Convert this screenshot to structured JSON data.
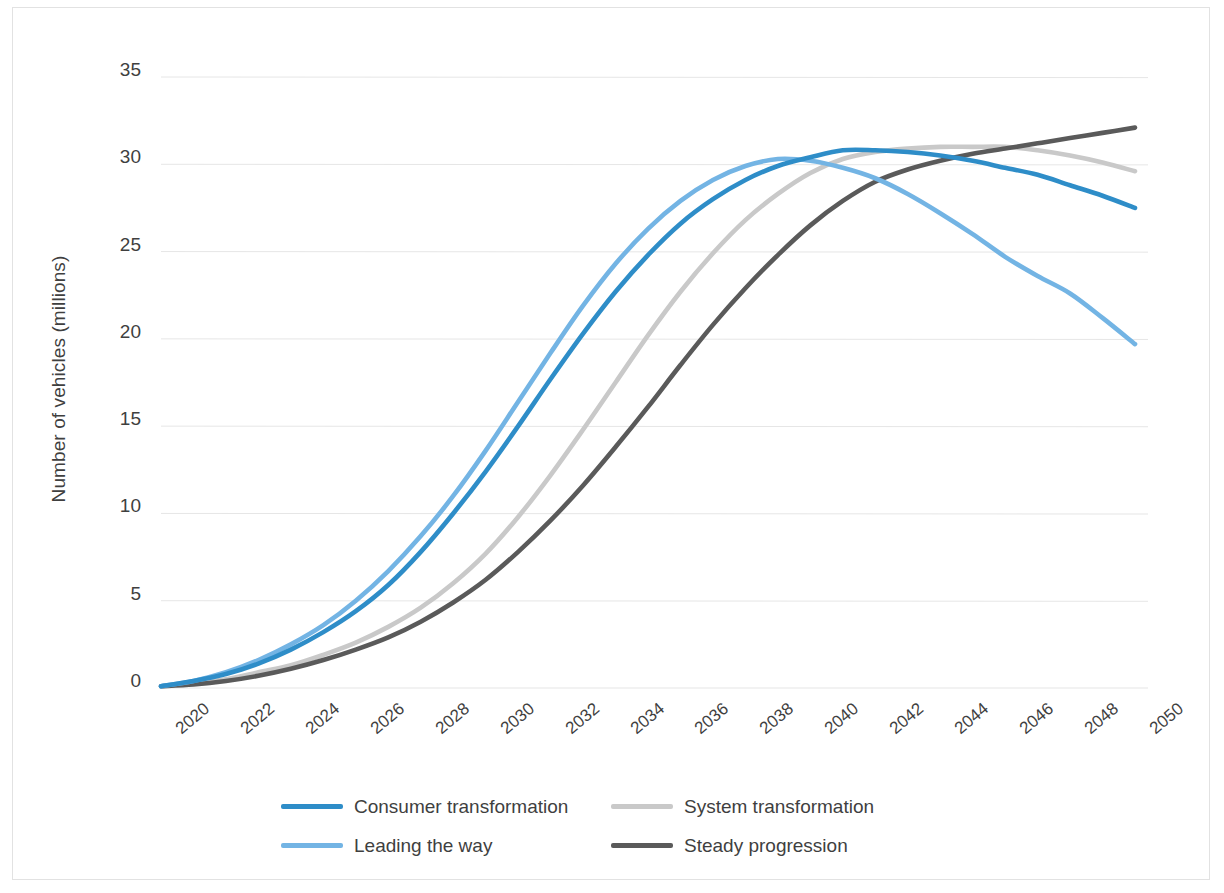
{
  "chart_data": {
    "type": "line",
    "title": "",
    "xlabel": "",
    "ylabel": "Number of vehicles (millions)",
    "xlim": [
      2020,
      2050
    ],
    "ylim": [
      0,
      35
    ],
    "ytick_values": [
      0,
      5,
      10,
      15,
      20,
      25,
      30,
      35
    ],
    "ytick_labels": [
      "0",
      "5",
      "10",
      "15",
      "20",
      "25",
      "30",
      "35"
    ],
    "xtick_labels": [
      "2020",
      "2022",
      "2024",
      "2026",
      "2028",
      "2030",
      "2032",
      "2034",
      "2036",
      "2038",
      "2040",
      "2042",
      "2044",
      "2046",
      "2048",
      "2050"
    ],
    "xtick_values": [
      2020,
      2022,
      2024,
      2026,
      2028,
      2030,
      2032,
      2034,
      2036,
      2038,
      2040,
      2042,
      2044,
      2046,
      2048,
      2050
    ],
    "grid": "horizontal",
    "legend_position": "bottom",
    "x": [
      2020,
      2021,
      2022,
      2023,
      2024,
      2025,
      2026,
      2027,
      2028,
      2029,
      2030,
      2031,
      2032,
      2033,
      2034,
      2035,
      2036,
      2037,
      2038,
      2039,
      2040,
      2041,
      2042,
      2043,
      2044,
      2045,
      2046,
      2047,
      2048,
      2049,
      2050
    ],
    "series": [
      {
        "name": "Consumer transformation",
        "color": "#2E8DC8",
        "values": [
          0.1,
          0.4,
          0.8,
          1.4,
          2.2,
          3.2,
          4.4,
          5.9,
          7.8,
          10.0,
          12.4,
          15.0,
          17.7,
          20.3,
          22.7,
          24.8,
          26.6,
          28.0,
          29.1,
          29.9,
          30.4,
          30.8,
          30.8,
          30.7,
          30.5,
          30.2,
          29.8,
          29.4,
          28.8,
          28.2,
          27.5
        ]
      },
      {
        "name": "System transformation",
        "color": "#C9C9C9",
        "values": [
          0.1,
          0.3,
          0.5,
          0.9,
          1.3,
          1.9,
          2.6,
          3.5,
          4.6,
          6.0,
          7.7,
          9.8,
          12.2,
          14.8,
          17.5,
          20.2,
          22.7,
          24.9,
          26.8,
          28.3,
          29.5,
          30.3,
          30.7,
          30.9,
          31.0,
          31.0,
          31.0,
          30.8,
          30.5,
          30.1,
          29.6
        ]
      },
      {
        "name": "Leading the way",
        "color": "#73B4E4",
        "values": [
          0.1,
          0.4,
          0.9,
          1.6,
          2.5,
          3.6,
          5.0,
          6.7,
          8.7,
          11.0,
          13.6,
          16.4,
          19.2,
          21.9,
          24.3,
          26.3,
          27.9,
          29.1,
          29.9,
          30.3,
          30.2,
          29.8,
          29.2,
          28.3,
          27.2,
          26.0,
          24.7,
          23.6,
          22.6,
          21.2,
          19.7
        ]
      },
      {
        "name": "Steady progression",
        "color": "#5A5A5A",
        "values": [
          0.1,
          0.2,
          0.4,
          0.7,
          1.1,
          1.6,
          2.2,
          2.9,
          3.8,
          4.9,
          6.2,
          7.8,
          9.6,
          11.6,
          13.8,
          16.1,
          18.5,
          20.8,
          22.9,
          24.8,
          26.5,
          27.9,
          29.0,
          29.7,
          30.2,
          30.6,
          30.9,
          31.2,
          31.5,
          31.8,
          32.1
        ]
      }
    ]
  },
  "legend": {
    "rows": [
      [
        {
          "label": "Consumer transformation",
          "color": "#2E8DC8",
          "name": "legend-item-consumer-transformation"
        },
        {
          "label": "System transformation",
          "color": "#C9C9C9",
          "name": "legend-item-system-transformation"
        }
      ],
      [
        {
          "label": "Leading the way",
          "color": "#73B4E4",
          "name": "legend-item-leading-the-way"
        },
        {
          "label": "Steady progression",
          "color": "#5A5A5A",
          "name": "legend-item-steady-progression"
        }
      ]
    ]
  },
  "style": {
    "gridline_color": "#E6E6E6",
    "border_color": "#E2E2E2",
    "text_color": "#3F3F3F",
    "background": "#FFFFFF"
  }
}
